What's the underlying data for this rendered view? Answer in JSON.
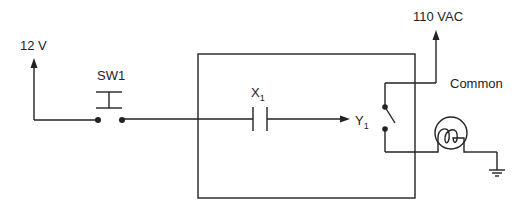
{
  "diagram": {
    "type": "circuit-schematic",
    "labels": {
      "supply_left": "12 V",
      "switch": "SW1",
      "input_contact": "X",
      "input_contact_sub": "1",
      "output": "Y",
      "output_sub": "1",
      "supply_right": "110 VAC",
      "common": "Common"
    },
    "components": [
      {
        "id": "source-12v",
        "kind": "voltage-source-arrow",
        "label": "12 V"
      },
      {
        "id": "sw1",
        "kind": "pushbutton-normally-open",
        "label": "SW1"
      },
      {
        "id": "controller-box",
        "kind": "plc-block"
      },
      {
        "id": "x1",
        "kind": "normally-open-contact",
        "label": "X1"
      },
      {
        "id": "y1",
        "kind": "relay-output-switch",
        "label": "Y1"
      },
      {
        "id": "source-110vac",
        "kind": "voltage-source-arrow",
        "label": "110 VAC"
      },
      {
        "id": "lamp",
        "kind": "lamp"
      },
      {
        "id": "ground",
        "kind": "ground"
      }
    ],
    "colors": {
      "line": "#222222",
      "background": "#ffffff"
    }
  }
}
